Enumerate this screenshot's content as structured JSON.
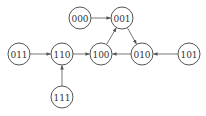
{
  "diagram": {
    "type": "state-transition-graph",
    "nodes": [
      {
        "id": "000",
        "label": "000",
        "x": 80,
        "y": 18
      },
      {
        "id": "001",
        "label": "001",
        "x": 122,
        "y": 18
      },
      {
        "id": "011",
        "label": "011",
        "x": 19,
        "y": 54
      },
      {
        "id": "110",
        "label": "110",
        "x": 62,
        "y": 54
      },
      {
        "id": "100",
        "label": "100",
        "x": 101,
        "y": 54
      },
      {
        "id": "010",
        "label": "010",
        "x": 142,
        "y": 54
      },
      {
        "id": "101",
        "label": "101",
        "x": 189,
        "y": 54
      },
      {
        "id": "111",
        "label": "111",
        "x": 62,
        "y": 97
      }
    ],
    "edges": [
      {
        "from": "000",
        "to": "001"
      },
      {
        "from": "001",
        "to": "010"
      },
      {
        "from": "010",
        "to": "100"
      },
      {
        "from": "100",
        "to": "001"
      },
      {
        "from": "101",
        "to": "010"
      },
      {
        "from": "011",
        "to": "110"
      },
      {
        "from": "110",
        "to": "100"
      },
      {
        "from": "111",
        "to": "110"
      }
    ],
    "node_radius": 11,
    "colors": {
      "stroke": "#555555",
      "text": "#333333",
      "background": "#ffffff"
    }
  }
}
